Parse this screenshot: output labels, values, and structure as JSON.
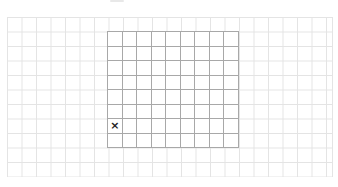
{
  "game": {
    "type": "grid-board",
    "outer_grid": {
      "color": "#e4e4e4",
      "cell_size": 14.5
    },
    "board": {
      "columns": 9,
      "rows": 8,
      "line_color": "#a8a8a8",
      "marks": [
        {
          "row": 6,
          "col": 0,
          "symbol": "×"
        }
      ]
    }
  }
}
